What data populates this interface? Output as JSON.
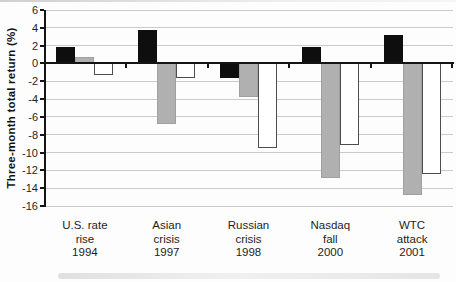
{
  "chart_data": {
    "type": "bar",
    "title": "",
    "xlabel": "",
    "ylabel": "Three-month total return (%)",
    "ylim": [
      -16,
      6
    ],
    "ytick_step": 2,
    "ytick_labels": [
      "6",
      "4",
      "2",
      "0",
      "-2",
      "-4",
      "-6",
      "-8",
      "-10",
      "-12",
      "-14",
      "-16"
    ],
    "grid": true,
    "legend": "none",
    "categories": [
      "U.S. rate rise 1994",
      "Asian crisis 1997",
      "Russian crisis 1998",
      "Nasdaq fall 2000",
      "WTC attack 2001"
    ],
    "category_label_lines": [
      [
        "U.S. rate",
        "rise",
        "1994"
      ],
      [
        "Asian",
        "crisis",
        "1997"
      ],
      [
        "Russian",
        "crisis",
        "1998"
      ],
      [
        "Nasdaq",
        "fall",
        "2000"
      ],
      [
        "WTC",
        "attack",
        "2001"
      ]
    ],
    "series": [
      {
        "name": "black-bars",
        "fill": "#0e0e0e",
        "border": "#0e0e0e",
        "values": [
          1.9,
          3.8,
          -1.6,
          1.9,
          3.2
        ]
      },
      {
        "name": "gray-bars",
        "fill": "#b0b0b0",
        "border": "#a0a0a0",
        "values": [
          0.7,
          -6.8,
          -3.8,
          -12.9,
          -14.8
        ]
      },
      {
        "name": "white-bars",
        "fill": "#ffffff",
        "border": "#4d4d4d",
        "values": [
          -1.3,
          -1.6,
          -9.5,
          -9.2,
          -12.4
        ]
      }
    ],
    "colors": {
      "grid": "#cbcbcb",
      "axis": "#141414",
      "text": "#1d1d1d"
    }
  }
}
